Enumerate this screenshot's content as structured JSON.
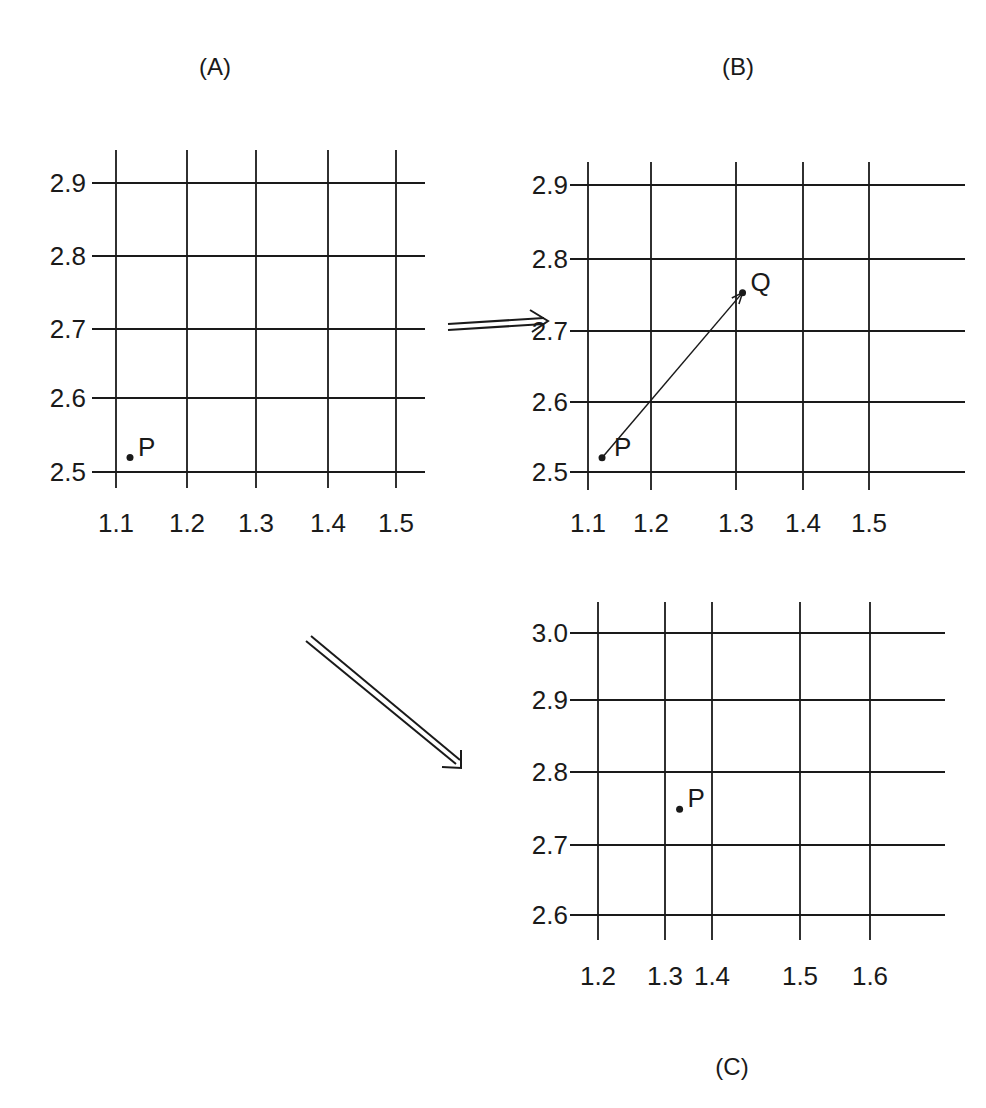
{
  "panels": [
    {
      "id": "A",
      "title": "(A)",
      "x_ticks": [
        "1.1",
        "1.2",
        "1.3",
        "1.4",
        "1.5"
      ],
      "y_ticks": [
        "2.5",
        "2.6",
        "2.7",
        "2.8",
        "2.9"
      ],
      "points": [
        {
          "label": "P",
          "x": 1.12,
          "y": 2.52
        }
      ]
    },
    {
      "id": "B",
      "title": "(B)",
      "x_ticks": [
        "1.1",
        "1.2",
        "1.3",
        "1.4",
        "1.5"
      ],
      "y_ticks": [
        "2.5",
        "2.6",
        "2.7",
        "2.8",
        "2.9"
      ],
      "points": [
        {
          "label": "P",
          "x": 1.12,
          "y": 2.52
        },
        {
          "label": "Q",
          "x": 1.32,
          "y": 2.75
        }
      ],
      "vector": {
        "from": "P",
        "to": "Q"
      }
    },
    {
      "id": "C",
      "title": "(C)",
      "x_ticks": [
        "1.2",
        "1.3",
        "1.4",
        "1.5",
        "1.6"
      ],
      "y_ticks": [
        "2.6",
        "2.7",
        "2.8",
        "2.9",
        "3.0"
      ],
      "points": [
        {
          "label": "P",
          "x": 1.32,
          "y": 2.75
        }
      ]
    }
  ],
  "arrows": [
    {
      "from": "A",
      "to": "B",
      "style": "double"
    },
    {
      "from": "A",
      "to": "C",
      "style": "double"
    }
  ]
}
